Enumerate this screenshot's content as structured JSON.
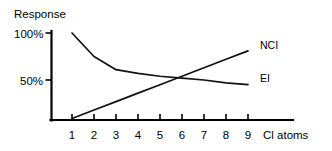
{
  "chart_data": {
    "type": "line",
    "title": "Response",
    "xlabel": "Cl atoms",
    "ylabel": "Response",
    "xlim": [
      0,
      10
    ],
    "ylim": [
      0,
      105
    ],
    "grid": false,
    "legend_position": "right-inline",
    "x_tick_labels": [
      "1",
      "2",
      "3",
      "4",
      "5",
      "6",
      "7",
      "8",
      "9"
    ],
    "x_ticks": [
      1,
      2,
      3,
      4,
      5,
      6,
      7,
      8,
      9
    ],
    "y_tick_labels": [
      "100%",
      "50%"
    ],
    "y_ticks": [
      100,
      50
    ],
    "x": [
      1,
      2,
      3,
      4,
      5,
      6,
      7,
      8,
      9
    ],
    "series": [
      {
        "name": "NCI",
        "label": "NCI",
        "values": [
          9,
          18,
          27,
          36,
          45,
          54,
          63,
          72,
          81
        ],
        "color": "#111111"
      },
      {
        "name": "EI",
        "label": "EI",
        "values": [
          100,
          75,
          61,
          57,
          54,
          52,
          50,
          47,
          45
        ],
        "color": "#111111"
      }
    ],
    "annotations": [
      {
        "text": "Response",
        "kind": "axis-title",
        "position": "top-left"
      },
      {
        "text": "Cl atoms",
        "kind": "axis-title",
        "position": "bottom-right"
      }
    ]
  },
  "labels": {
    "y_axis_title": "Response",
    "x_axis_title": "Cl atoms",
    "y_tick_100": "100%",
    "y_tick_50": "50%",
    "series_nci": "NCI",
    "series_ei": "EI",
    "x_tick_1": "1",
    "x_tick_2": "2",
    "x_tick_3": "3",
    "x_tick_4": "4",
    "x_tick_5": "5",
    "x_tick_6": "6",
    "x_tick_7": "7",
    "x_tick_8": "8",
    "x_tick_9": "9"
  },
  "colors": {
    "background": "#ffffff",
    "axis": "#000000",
    "line": "#111111",
    "text": "#000000"
  }
}
